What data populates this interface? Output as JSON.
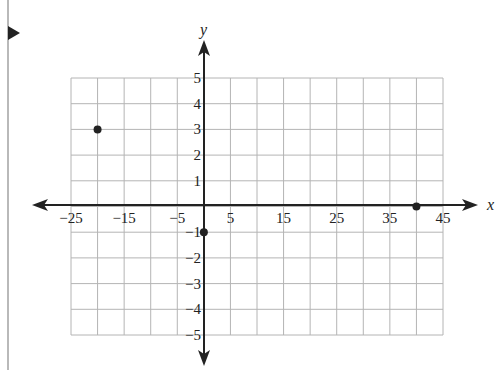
{
  "chart_data": {
    "type": "scatter",
    "title": "",
    "xlabel": "x",
    "ylabel": "y",
    "xlim": [
      -25,
      45
    ],
    "ylim": [
      -5,
      5
    ],
    "grid": true,
    "x_ticks": [
      "−25",
      "−15",
      "−5",
      "5",
      "15",
      "25",
      "35",
      "45"
    ],
    "y_ticks": [
      "5",
      "4",
      "3",
      "2",
      "1",
      "−1",
      "−2",
      "−3",
      "−4",
      "−5"
    ],
    "x_grid_step": 5,
    "y_grid_step": 1,
    "points": [
      {
        "x": -20,
        "y": 3
      },
      {
        "x": 0,
        "y": -1
      },
      {
        "x": 40,
        "y": 0
      }
    ]
  },
  "colors": {
    "grid": "#b4b4b4",
    "axis": "#222222",
    "point": "#222222"
  }
}
